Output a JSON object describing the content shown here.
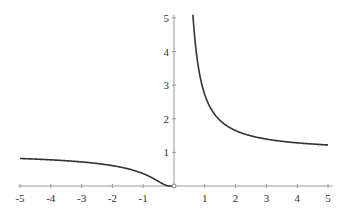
{
  "chart_data": {
    "type": "line",
    "title": "",
    "xlabel": "",
    "ylabel": "",
    "function": "exp(1/x)",
    "xlim": [
      -5,
      5
    ],
    "ylim": [
      0,
      5
    ],
    "x_ticks": [
      -5,
      -4,
      -3,
      -2,
      -1,
      1,
      2,
      3,
      4,
      5
    ],
    "y_ticks": [
      1,
      2,
      3,
      4,
      5
    ],
    "grid": false,
    "legend": null,
    "series": [
      {
        "name": "left branch",
        "x": [
          -5,
          -4,
          -3,
          -2,
          -1,
          -0.5,
          -0.25,
          0
        ],
        "values": [
          0.82,
          0.78,
          0.72,
          0.61,
          0.37,
          0.14,
          0.02,
          0
        ]
      },
      {
        "name": "right branch",
        "x": [
          0.62,
          0.75,
          1,
          1.5,
          2,
          3,
          4,
          5
        ],
        "values": [
          5.0,
          3.79,
          2.72,
          1.95,
          1.65,
          1.4,
          1.28,
          1.22
        ]
      }
    ],
    "annotations": [
      "open circle at origin (0,0)"
    ],
    "colors": {
      "curve": "#333333",
      "axis": "#999999",
      "text": "#333333"
    }
  }
}
